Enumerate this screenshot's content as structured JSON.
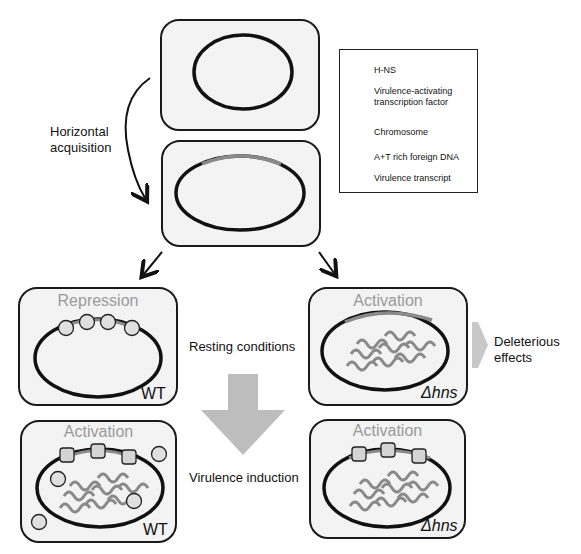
{
  "figure": {
    "left_label": [
      "Horizontal",
      "acquisition"
    ],
    "middle_labels": {
      "resting": "Resting conditions",
      "induction": "Virulence induction"
    },
    "right_label": [
      "Deleterious",
      "effects"
    ],
    "panels": [
      {
        "id": "wt-resting",
        "state": "Repression",
        "genotype": "WT"
      },
      {
        "id": "hns-resting",
        "state": "Activation",
        "genotype": "Δhns"
      },
      {
        "id": "wt-induction",
        "state": "Activation",
        "genotype": "WT"
      },
      {
        "id": "hns-induction",
        "state": "Activation",
        "genotype": "Δhns"
      }
    ]
  },
  "legend": {
    "items": [
      {
        "icon": "circle-icon",
        "label": "H-NS"
      },
      {
        "icon": "rounded-square-icon",
        "label_line1": "Virulence-activating",
        "label_line2": "transcription factor"
      },
      {
        "icon": "ring-icon",
        "label": "Chromosome"
      },
      {
        "icon": "arc-icon",
        "label": "A+T rich foreign DNA"
      },
      {
        "icon": "wave-icon",
        "label": "Virulence transcript"
      }
    ]
  },
  "colors": {
    "cell_fill": "#f3f3f3",
    "outline": "#1a1a1a",
    "foreign_dna": "#8a8a8a",
    "protein_fill": "#d4d4d4",
    "state_text": "#9a9a9a",
    "big_arrow": "#bdbdbd"
  }
}
